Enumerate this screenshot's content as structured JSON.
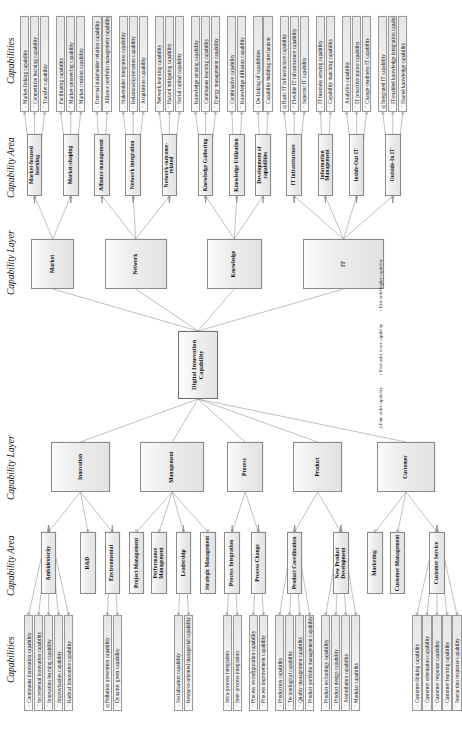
{
  "figure": {
    "core": "Digital Innovation Capability",
    "headers": {
      "capabilities_left": "Capabilities",
      "area_left": "Capability Area",
      "layer_left": "Capability Layer",
      "layer_right": "Capability Layer",
      "area_right": "Capability Area",
      "capabilities_right": "Capabilities"
    },
    "legend": [
      {
        "marker": "◎",
        "text": "Firm-order capability"
      },
      {
        "marker": "↓",
        "text": "First-order lower capability"
      },
      {
        "marker": "↑",
        "text": "First-order higher capability"
      }
    ],
    "layers": [
      {
        "id": "innovation",
        "name": "Innovation",
        "side": "left",
        "areas": [
          {
            "name": "Ambidexterity",
            "capabilities": [
              {
                "marker": "↓",
                "text": "Continuous innovation capability"
              },
              {
                "marker": "↑",
                "text": "Incremental innovation capability"
              },
              {
                "marker": "↑",
                "text": "Innovation learning capability"
              },
              {
                "marker": "↑",
                "text": "Improvisation capability"
              },
              {
                "marker": "↑",
                "text": "Radical innovative capability"
              }
            ]
          },
          {
            "name": "R&D",
            "capabilities": []
          },
          {
            "name": "Environmental",
            "capabilities": [
              {
                "marker": "◎",
                "text": "Pollution prevention capability"
              },
              {
                "marker": "↑",
                "text": "Dynamic green capability"
              }
            ]
          }
        ]
      },
      {
        "id": "management",
        "name": "Management",
        "side": "left",
        "areas": [
          {
            "name": "Project Management",
            "capabilities": []
          },
          {
            "name": "Performance Management",
            "capabilities": []
          },
          {
            "name": "Leadership",
            "capabilities": [
              {
                "marker": "↓",
                "text": "Socialization capability"
              },
              {
                "marker": "↑",
                "text": "Resource-oriented managerial capability"
              }
            ]
          },
          {
            "name": "Strategic Management",
            "capabilities": []
          }
        ]
      },
      {
        "id": "process",
        "name": "Process",
        "side": "left",
        "areas": [
          {
            "name": "Process Integration",
            "capabilities": [
              {
                "marker": "↓",
                "text": "Intra-process integration"
              },
              {
                "marker": "↑",
                "text": "Inter-process integration"
              }
            ]
          },
          {
            "name": "Process Change",
            "capabilities": [
              {
                "marker": "↑",
                "text": "Process reconfiguration capability"
              },
              {
                "marker": "↑",
                "text": "Process improvement capability"
              }
            ]
          }
        ]
      },
      {
        "id": "product",
        "name": "Product",
        "side": "left",
        "areas": [
          {
            "name": "Product Coordination",
            "capabilities": [
              {
                "marker": "↓",
                "text": "Production capability"
              },
              {
                "marker": "↑",
                "text": "Technological capability"
              },
              {
                "marker": "↑",
                "text": "Quality management capability"
              },
              {
                "marker": "↑",
                "text": "Product portfolio management capability"
              }
            ]
          },
          {
            "name": "New Product Development",
            "capabilities": [
              {
                "marker": "↓",
                "text": "Product technology capability"
              },
              {
                "marker": "↑",
                "text": "Product design capability"
              },
              {
                "marker": "↑",
                "text": "Assimilation capability"
              },
              {
                "marker": "↑",
                "text": "Modular capability"
              }
            ]
          }
        ]
      },
      {
        "id": "customer",
        "name": "Customer",
        "side": "left",
        "areas": [
          {
            "name": "Marketing",
            "capabilities": []
          },
          {
            "name": "Customer Management",
            "capabilities": []
          },
          {
            "name": "Customer Service",
            "capabilities": [
              {
                "marker": "↓",
                "text": "Customer-linking capability"
              },
              {
                "marker": "↑",
                "text": "Customer orientation capability"
              },
              {
                "marker": "↑",
                "text": "Customer response capability"
              },
              {
                "marker": "↑",
                "text": "Customer learning capability"
              },
              {
                "marker": "↑",
                "text": "Interaction response capability"
              }
            ]
          }
        ]
      },
      {
        "id": "market",
        "name": "Market",
        "side": "right",
        "areas": [
          {
            "name": "Market-focused learning",
            "capabilities": [
              {
                "marker": "↓",
                "text": "Market-linking capability"
              },
              {
                "marker": "↑",
                "text": "Competitive learning capability"
              },
              {
                "marker": "↑",
                "text": "Transfer capability"
              }
            ]
          },
          {
            "name": "Market-shaping",
            "capabilities": [
              {
                "marker": "↓",
                "text": "Facilitating capability"
              },
              {
                "marker": "↑",
                "text": "Market-pioneering capability"
              },
              {
                "marker": "↑",
                "text": "Market creation capability"
              }
            ]
          }
        ]
      },
      {
        "id": "network",
        "name": "Network",
        "side": "right",
        "areas": [
          {
            "name": "Alliance management",
            "capabilities": [
              {
                "marker": "↓",
                "text": "External stakeholder relation capability"
              },
              {
                "marker": "↑",
                "text": "Alliance portfolio management capability"
              }
            ]
          },
          {
            "name": "Network integration",
            "capabilities": [
              {
                "marker": "↓",
                "text": "Stakeholder integration capability"
              },
              {
                "marker": "↑",
                "text": "Relationship iteration capability"
              },
              {
                "marker": "↑",
                "text": "Acquisition capability"
              }
            ]
          },
          {
            "name": "Network-outcome-related",
            "capabilities": [
              {
                "marker": "↑",
                "text": "Network learning capability"
              },
              {
                "marker": "↑",
                "text": "Hazard mitigating capability"
              },
              {
                "marker": "↑",
                "text": "Social capital capability"
              }
            ]
          }
        ]
      },
      {
        "id": "knowledge",
        "name": "Knowledge",
        "side": "right",
        "areas": [
          {
            "name": "Knowledge Gathering",
            "capabilities": [
              {
                "marker": "↓",
                "text": "Knowledge sensing capability"
              },
              {
                "marker": "↑",
                "text": "Continuous learning capability"
              },
              {
                "marker": "↑",
                "text": "Energy management capability"
              }
            ]
          },
          {
            "name": "Knowledge Utilization",
            "capabilities": [
              {
                "marker": "↓",
                "text": "Combinative capability"
              },
              {
                "marker": "↑",
                "text": "Knowledge diffusion capability"
              }
            ]
          },
          {
            "name": "Development of capabilities",
            "capabilities": [
              {
                "marker": "↓",
                "text": "De-linking of capabilities"
              },
              {
                "marker": "↑",
                "text": "Capability building mechanism"
              }
            ]
          }
        ]
      },
      {
        "id": "it",
        "name": "IT",
        "side": "right",
        "areas": [
          {
            "name": "IT Infrastructure",
            "capabilities": [
              {
                "marker": "◎",
                "text": "Basic IT infrastructure capability"
              },
              {
                "marker": "↑",
                "text": "Flexible IT infrastructure capability"
              },
              {
                "marker": "↑",
                "text": "Superior IT capability"
              }
            ]
          },
          {
            "name": "Information Management",
            "capabilities": [
              {
                "marker": "↓",
                "text": "IT business sensing capability"
              },
              {
                "marker": "↑",
                "text": "Capability matching capability"
              }
            ]
          },
          {
            "name": "Inside-Out IT",
            "capabilities": [
              {
                "marker": "↓",
                "text": "Analytics capability"
              },
              {
                "marker": "↑",
                "text": "IT proactive stance capability"
              },
              {
                "marker": "↑",
                "text": "Change-readiness IT capability"
              }
            ]
          },
          {
            "name": "Outside-In IT",
            "capabilities": [
              {
                "marker": "◎",
                "text": "Integrated IT capability"
              },
              {
                "marker": "↑",
                "text": "IT-enabled knowledge integration capability"
              },
              {
                "marker": "↑",
                "text": "Shared knowledge capability"
              }
            ]
          }
        ]
      }
    ]
  }
}
